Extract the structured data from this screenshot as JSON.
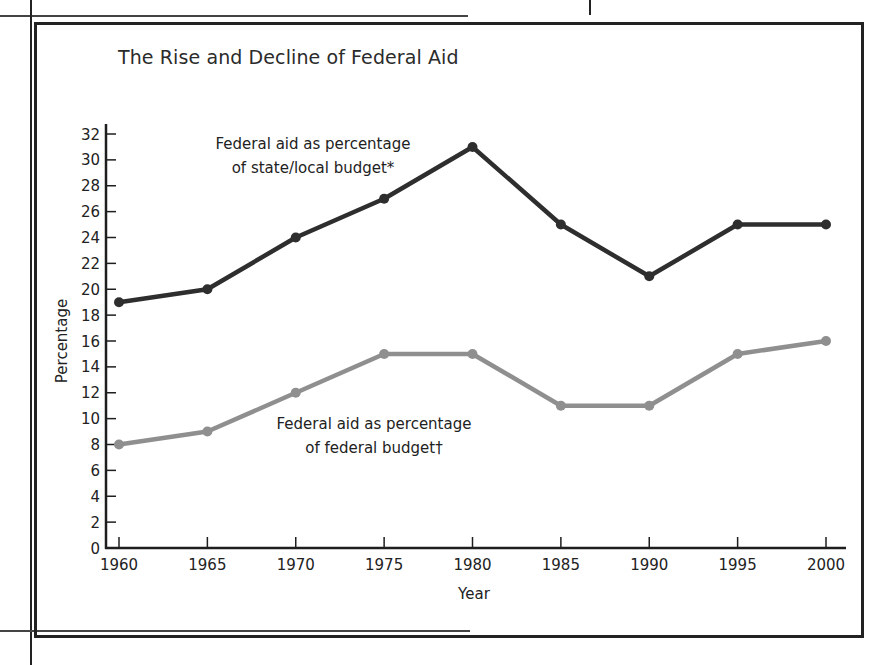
{
  "page": {
    "title": "The Rise and Decline of Federal Aid"
  },
  "chart_data": {
    "type": "line",
    "title": "The Rise and Decline of Federal Aid",
    "xlabel": "Year",
    "ylabel": "Percentage",
    "x": [
      1960,
      1965,
      1970,
      1975,
      1980,
      1985,
      1990,
      1995,
      2000
    ],
    "x_tick_labels": [
      "1960",
      "1965",
      "1970",
      "1975",
      "1980",
      "1985",
      "1990",
      "1995",
      "2000"
    ],
    "y_tick_labels": [
      "0",
      "2",
      "4",
      "6",
      "8",
      "10",
      "12",
      "14",
      "16",
      "18",
      "20",
      "22",
      "24",
      "26",
      "28",
      "30",
      "32"
    ],
    "ylim": [
      0,
      32
    ],
    "grid": false,
    "legend": "none (inline annotations)",
    "series": [
      {
        "name": "Federal aid as percentage of state/local budget*",
        "annotation_lines": [
          "Federal aid as percentage",
          "of state/local budget*"
        ],
        "color": "#2e2e2e",
        "values": [
          19,
          20,
          24,
          27,
          31,
          25,
          21,
          25,
          25
        ]
      },
      {
        "name": "Federal aid as percentage of federal budget†",
        "annotation_lines": [
          "Federal aid as percentage",
          "of federal budget†"
        ],
        "color": "#8f8f8f",
        "values": [
          8,
          9,
          12,
          15,
          15,
          11,
          11,
          15,
          16
        ]
      }
    ]
  }
}
